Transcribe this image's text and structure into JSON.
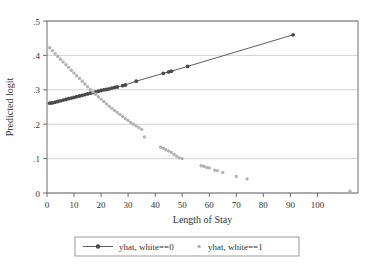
{
  "chart_data": {
    "type": "scatter",
    "title": "",
    "xlabel": "Length of Stay",
    "ylabel": "Predicted logit",
    "xlim": [
      0,
      115
    ],
    "ylim": [
      0,
      0.5
    ],
    "xticks": [
      0,
      10,
      20,
      30,
      40,
      50,
      60,
      70,
      80,
      90,
      100
    ],
    "xtick_labels": [
      "0",
      "10",
      "20",
      "30",
      "40",
      "50",
      "60",
      "70",
      "80",
      "90",
      "100"
    ],
    "yticks": [
      0,
      0.1,
      0.2,
      0.3,
      0.4,
      0.5
    ],
    "ytick_labels": [
      "0",
      ".1",
      ".2",
      ".3",
      ".4",
      ".5"
    ],
    "grid": "horizontal",
    "legend_position": "below-center",
    "series": [
      {
        "name": "yhat, white==0",
        "color": "#4a4a4a",
        "marker": "circle",
        "line": true,
        "points": [
          [
            1,
            0.261
          ],
          [
            2,
            0.262
          ],
          [
            3,
            0.264
          ],
          [
            4,
            0.266
          ],
          [
            5,
            0.268
          ],
          [
            6,
            0.27
          ],
          [
            7,
            0.272
          ],
          [
            8,
            0.274
          ],
          [
            9,
            0.276
          ],
          [
            10,
            0.278
          ],
          [
            11,
            0.28
          ],
          [
            12,
            0.282
          ],
          [
            13,
            0.284
          ],
          [
            14,
            0.286
          ],
          [
            15,
            0.288
          ],
          [
            16,
            0.29
          ],
          [
            17,
            0.292
          ],
          [
            18,
            0.294
          ],
          [
            19,
            0.296
          ],
          [
            20,
            0.298
          ],
          [
            21,
            0.3
          ],
          [
            22,
            0.301
          ],
          [
            23,
            0.303
          ],
          [
            24,
            0.305
          ],
          [
            25,
            0.307
          ],
          [
            26,
            0.308
          ],
          [
            28,
            0.312
          ],
          [
            29,
            0.314
          ],
          [
            33,
            0.325
          ],
          [
            43,
            0.348
          ],
          [
            45,
            0.352
          ],
          [
            46,
            0.354
          ],
          [
            52,
            0.368
          ],
          [
            91,
            0.46
          ]
        ]
      },
      {
        "name": "yhat, white==1",
        "color": "#b3b3b3",
        "marker": "circle",
        "line": false,
        "points": [
          [
            1,
            0.422
          ],
          [
            2,
            0.414
          ],
          [
            3,
            0.405
          ],
          [
            4,
            0.397
          ],
          [
            5,
            0.389
          ],
          [
            6,
            0.381
          ],
          [
            7,
            0.373
          ],
          [
            8,
            0.365
          ],
          [
            9,
            0.357
          ],
          [
            10,
            0.349
          ],
          [
            11,
            0.341
          ],
          [
            12,
            0.333
          ],
          [
            13,
            0.325
          ],
          [
            14,
            0.317
          ],
          [
            15,
            0.309
          ],
          [
            16,
            0.301
          ],
          [
            17,
            0.294
          ],
          [
            18,
            0.287
          ],
          [
            19,
            0.28
          ],
          [
            20,
            0.273
          ],
          [
            21,
            0.266
          ],
          [
            22,
            0.259
          ],
          [
            23,
            0.252
          ],
          [
            24,
            0.246
          ],
          [
            25,
            0.24
          ],
          [
            26,
            0.234
          ],
          [
            27,
            0.228
          ],
          [
            28,
            0.222
          ],
          [
            29,
            0.216
          ],
          [
            30,
            0.211
          ],
          [
            31,
            0.205
          ],
          [
            32,
            0.2
          ],
          [
            33,
            0.195
          ],
          [
            34,
            0.19
          ],
          [
            35,
            0.185
          ],
          [
            36,
            0.163
          ],
          [
            42,
            0.133
          ],
          [
            43,
            0.13
          ],
          [
            44,
            0.126
          ],
          [
            45,
            0.122
          ],
          [
            46,
            0.118
          ],
          [
            47,
            0.112
          ],
          [
            48,
            0.107
          ],
          [
            49,
            0.102
          ],
          [
            50,
            0.1
          ],
          [
            57,
            0.079
          ],
          [
            58,
            0.078
          ],
          [
            59,
            0.074
          ],
          [
            60,
            0.073
          ],
          [
            62,
            0.066
          ],
          [
            63,
            0.065
          ],
          [
            65,
            0.06
          ],
          [
            70,
            0.048
          ],
          [
            74,
            0.041
          ],
          [
            112,
            0.005
          ]
        ]
      }
    ]
  },
  "legend": {
    "entries": [
      {
        "label": "yhat, white==0",
        "marker": "line-dot",
        "color": "#4a4a4a"
      },
      {
        "label": "yhat, white==1",
        "marker": "dot",
        "color": "#b3b3b3"
      }
    ]
  },
  "colors": {
    "series_dark": "#4a4a4a",
    "series_light": "#b3b3b3",
    "grid": "#c8c8c8",
    "frame": "#6e6e6e",
    "text": "#333333"
  }
}
